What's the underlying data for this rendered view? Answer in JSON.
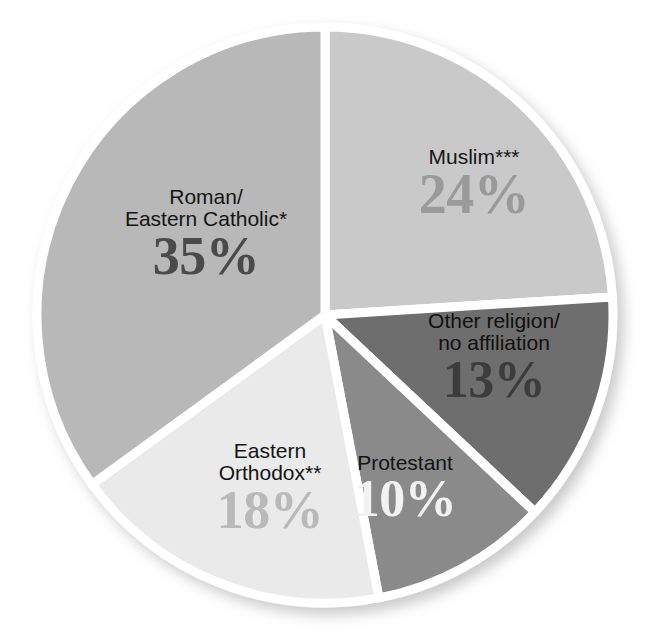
{
  "title": "",
  "chart_data": {
    "type": "pie",
    "title": "",
    "subtitle": "",
    "xlabel": "",
    "ylabel": "",
    "legend_position": "none",
    "grid": false,
    "units": "percent",
    "start_angle_deg": 0,
    "direction": "clockwise",
    "categories": [
      "Muslim***",
      "Other religion/ no affiliation",
      "Protestant",
      "Eastern Orthodox**",
      "Roman/ Eastern Catholic*"
    ],
    "values": [
      24,
      13,
      10,
      18,
      35
    ],
    "slices": [
      {
        "id": "muslim",
        "name_line1": "Muslim***",
        "name_line2": "",
        "value": 24,
        "value_label": "24%",
        "fill": "#c9c9c9",
        "pct_color": "#9a9a9a",
        "name_color": "#161616"
      },
      {
        "id": "other-religion",
        "name_line1": "Other religion/",
        "name_line2": "no affiliation",
        "value": 13,
        "value_label": "13%",
        "fill": "#6e6e6e",
        "pct_color": "#3c3c3c",
        "name_color": "#101010"
      },
      {
        "id": "protestant",
        "name_line1": "Protestant",
        "name_line2": "",
        "value": 10,
        "value_label": "10%",
        "fill": "#8a8a8a",
        "pct_color": "#f2f2f2",
        "name_color": "#131313"
      },
      {
        "id": "eastern-orthodox",
        "name_line1": "Eastern",
        "name_line2": "Orthodox**",
        "value": 18,
        "value_label": "18%",
        "fill": "#eaeaea",
        "pct_color": "#b9b9b9",
        "name_color": "#141414"
      },
      {
        "id": "roman-eastern-catholic",
        "name_line1": "Roman/",
        "name_line2": "Eastern Catholic*",
        "value": 35,
        "value_label": "35%",
        "fill": "#b8b8b8",
        "pct_color": "#4a4a4a",
        "name_color": "#141414"
      }
    ],
    "separator_color": "#ffffff",
    "background": "#ffffff"
  }
}
